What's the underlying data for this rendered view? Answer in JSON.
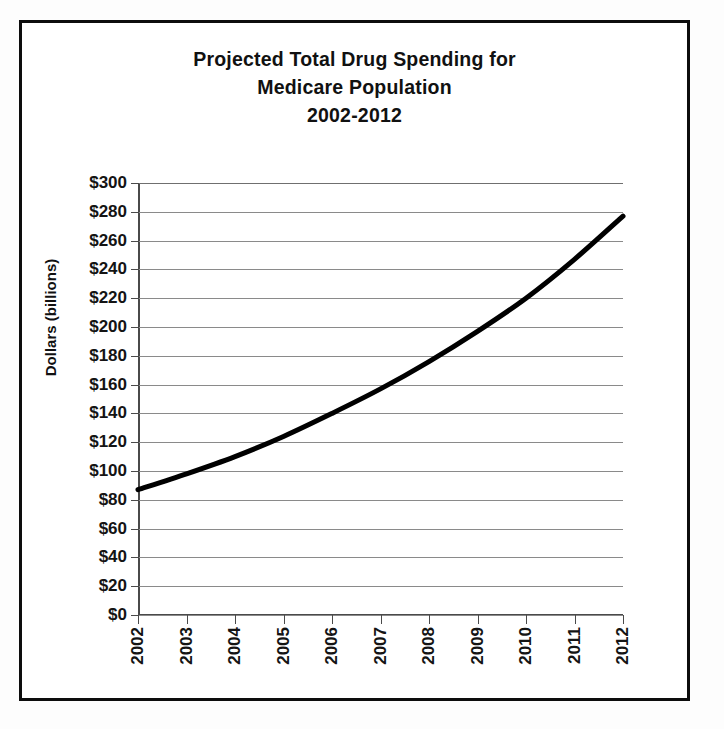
{
  "figure": {
    "border_color": "#0d0d0d",
    "background": "#ffffff"
  },
  "title": {
    "line1": "Projected Total Drug Spending for",
    "line2": "Medicare Population",
    "line3": "2002-2012"
  },
  "axes": {
    "y_title": "Dollars (billions)",
    "y_tick_labels": [
      "$300",
      "$280",
      "$260",
      "$240",
      "$220",
      "$200",
      "$180",
      "$160",
      "$140",
      "$120",
      "$100",
      "$80",
      "$60",
      "$40",
      "$20",
      "$0"
    ],
    "x_tick_labels": [
      "2002",
      "2003",
      "2004",
      "2005",
      "2006",
      "2007",
      "2008",
      "2009",
      "2010",
      "2011",
      "2012"
    ]
  },
  "chart_data": {
    "type": "line",
    "title": "Projected Total Drug Spending for Medicare Population 2002-2012",
    "xlabel": "",
    "ylabel": "Dollars (billions)",
    "x": [
      "2002",
      "2003",
      "2004",
      "2005",
      "2006",
      "2007",
      "2008",
      "2009",
      "2010",
      "2011",
      "2012"
    ],
    "values": [
      87,
      98,
      110,
      124,
      140,
      157,
      176,
      197,
      220,
      247,
      277
    ],
    "y_unit": "billions of dollars",
    "y_prefix": "$",
    "ylim": [
      0,
      300
    ],
    "ytick_step": 20,
    "grid": "horizontal",
    "legend": "none",
    "series_color": "#000000",
    "series_width_px": 5
  }
}
